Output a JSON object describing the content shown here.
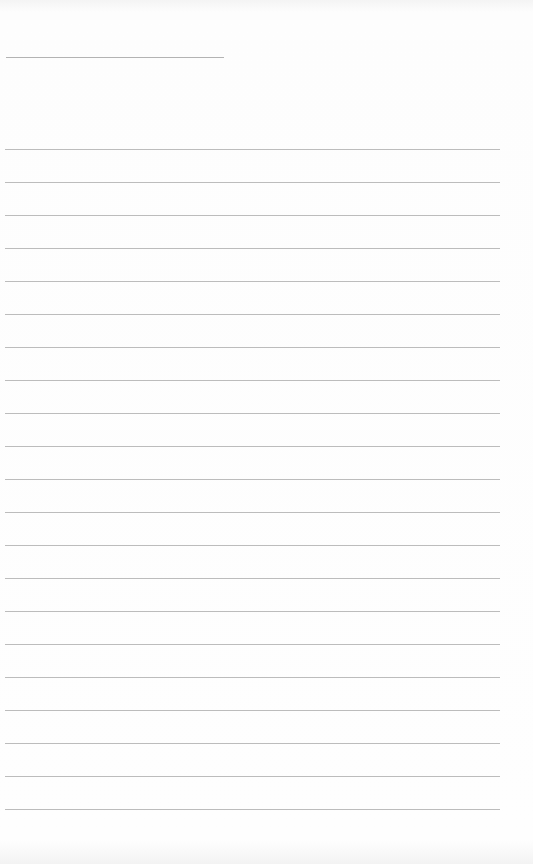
{
  "document": {
    "type": "blank lined writing sheet",
    "header": {
      "short_line": {
        "x": 6,
        "y": 57,
        "width": 218
      }
    },
    "ruled_lines": {
      "count": 21,
      "first_y": 149,
      "spacing": 33,
      "x": 5,
      "width": 495,
      "color": "#a0a0a0"
    },
    "background_color": "#fdfdfd"
  }
}
